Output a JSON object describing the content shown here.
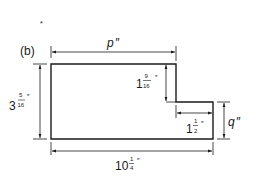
{
  "figure": {
    "panel_label": "(b)",
    "stray_mark": "*",
    "shape": "L-shaped stepped plate (rectangle with notch in upper-right corner)",
    "dimensions": {
      "top_width": {
        "whole": "p",
        "unit": "″",
        "variable": true
      },
      "overall_height": {
        "whole": "3",
        "num": "5",
        "den": "16",
        "unit": "″"
      },
      "step_height": {
        "whole": "1",
        "num": "9",
        "den": "16",
        "unit": "″"
      },
      "step_width": {
        "whole": "1",
        "num": "1",
        "den": "2",
        "unit": "″"
      },
      "right_height": {
        "whole": "q",
        "unit": "″",
        "variable": true
      },
      "bottom_width": {
        "whole": "10",
        "num": "1",
        "den": "4",
        "unit": "″"
      }
    },
    "colors": {
      "line": "#1a1a1a",
      "background": "#ffffff"
    }
  }
}
